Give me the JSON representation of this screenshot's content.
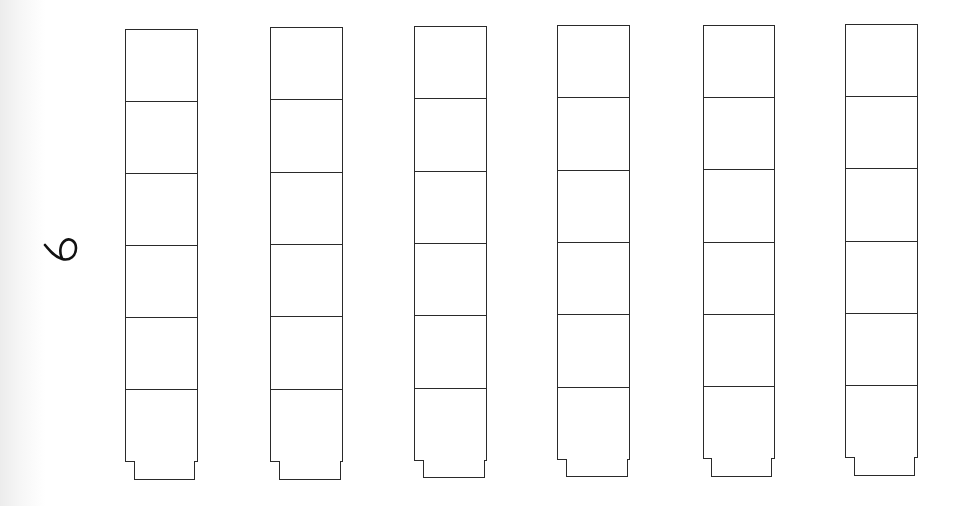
{
  "worksheet": {
    "number_label": "6",
    "cubes_per_tower": 6,
    "towers": [
      {
        "id": 1,
        "cubes": 6
      },
      {
        "id": 2,
        "cubes": 6
      },
      {
        "id": 3,
        "cubes": 6
      },
      {
        "id": 4,
        "cubes": 6
      },
      {
        "id": 5,
        "cubes": 6
      },
      {
        "id": 6,
        "cubes": 6
      }
    ],
    "line_color": "#2a2a2a",
    "handwriting_color": "#111111"
  }
}
